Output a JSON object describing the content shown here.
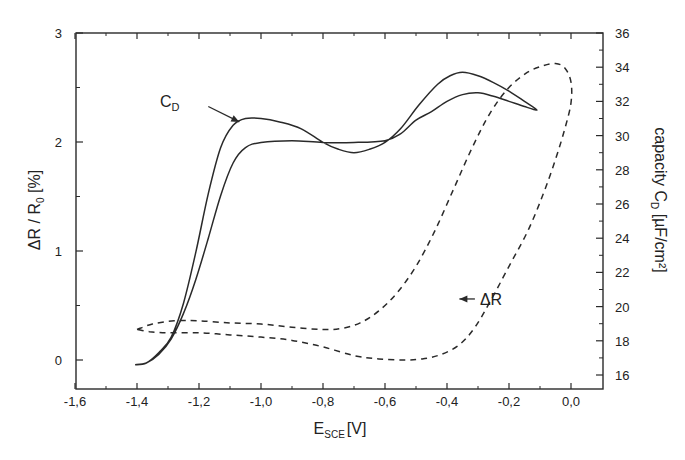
{
  "chart_data": {
    "type": "line",
    "title": "",
    "xlabel": "E_SCE [V]",
    "xlabel_main": "E",
    "xlabel_sub": "SCE",
    "xlabel_unit": "[V]",
    "ylabel_left": "ΔR / R0 [%]",
    "ylabel_left_main": "ΔR / R",
    "ylabel_left_sub": "0",
    "ylabel_left_unit": " [%]",
    "ylabel_right": "capacity C_D [µF/cm²]",
    "ylabel_right_main": "capacity C",
    "ylabel_right_sub": "D",
    "ylabel_right_unit": " [µF/cm²]",
    "xlim": [
      -1.6,
      0.1
    ],
    "ylim_left": [
      -0.26,
      3.0
    ],
    "ylim_right": [
      15.0,
      36.0
    ],
    "grid": false,
    "legend": "none (inline annotations)",
    "x_ticks": [
      -1.6,
      -1.4,
      -1.2,
      -1.0,
      -0.8,
      -0.6,
      -0.4,
      -0.2,
      0.0
    ],
    "x_tick_labels": [
      "-1,6",
      "-1,4",
      "-1,2",
      "-1,0",
      "-0,8",
      "-0,6",
      "-0,4",
      "-0,2",
      "0,0"
    ],
    "y_left_ticks": [
      0,
      1,
      2,
      3
    ],
    "y_left_tick_labels": [
      "0",
      "1",
      "2",
      "3"
    ],
    "y_right_ticks": [
      16,
      18,
      20,
      22,
      24,
      26,
      28,
      30,
      32,
      34,
      36
    ],
    "y_right_tick_labels": [
      "16",
      "18",
      "20",
      "22",
      "24",
      "26",
      "28",
      "30",
      "32",
      "34",
      "36"
    ],
    "annotations": [
      {
        "text_main": "C",
        "text_sub": "D",
        "target": "C_D curve",
        "arrow_from": [
          -1.17,
          31.7
        ],
        "arrow_to": [
          -1.07,
          30.8
        ]
      },
      {
        "text_main": "ΔR",
        "text_sub": "",
        "target": "ΔR curve",
        "arrow_from": [
          -0.31,
          0.56
        ],
        "arrow_to": [
          -0.36,
          0.56
        ]
      }
    ],
    "series": [
      {
        "name": "C_D",
        "axis": "right",
        "unit": "µF/cm²",
        "style": "solid",
        "points": [
          [
            -1.406,
            16.6
          ],
          [
            -1.37,
            16.7
          ],
          [
            -1.33,
            17.3
          ],
          [
            -1.29,
            18.2
          ],
          [
            -1.25,
            20.2
          ],
          [
            -1.21,
            23.2
          ],
          [
            -1.17,
            26.6
          ],
          [
            -1.13,
            29.3
          ],
          [
            -1.09,
            30.6
          ],
          [
            -1.05,
            31.0
          ],
          [
            -1.0,
            31.0
          ],
          [
            -0.94,
            30.8
          ],
          [
            -0.87,
            30.4
          ],
          [
            -0.8,
            29.6
          ],
          [
            -0.75,
            29.2
          ],
          [
            -0.7,
            29.0
          ],
          [
            -0.65,
            29.2
          ],
          [
            -0.6,
            29.6
          ],
          [
            -0.55,
            30.4
          ],
          [
            -0.49,
            31.8
          ],
          [
            -0.43,
            33.0
          ],
          [
            -0.39,
            33.5
          ],
          [
            -0.35,
            33.7
          ],
          [
            -0.3,
            33.5
          ],
          [
            -0.25,
            33.1
          ],
          [
            -0.2,
            32.6
          ],
          [
            -0.15,
            32.0
          ],
          [
            -0.11,
            31.5
          ],
          [
            -0.15,
            31.7
          ],
          [
            -0.2,
            32.0
          ],
          [
            -0.25,
            32.3
          ],
          [
            -0.3,
            32.5
          ],
          [
            -0.35,
            32.4
          ],
          [
            -0.4,
            32.0
          ],
          [
            -0.45,
            31.4
          ],
          [
            -0.5,
            30.9
          ],
          [
            -0.55,
            30.1
          ],
          [
            -0.6,
            29.7
          ],
          [
            -0.7,
            29.6
          ],
          [
            -0.8,
            29.6
          ],
          [
            -0.9,
            29.7
          ],
          [
            -1.0,
            29.6
          ],
          [
            -1.05,
            29.3
          ],
          [
            -1.09,
            28.4
          ],
          [
            -1.13,
            26.5
          ],
          [
            -1.17,
            24.0
          ],
          [
            -1.21,
            21.6
          ],
          [
            -1.25,
            19.6
          ],
          [
            -1.29,
            18.1
          ],
          [
            -1.33,
            17.2
          ],
          [
            -1.37,
            16.7
          ],
          [
            -1.406,
            16.6
          ]
        ]
      },
      {
        "name": "ΔR",
        "axis": "left",
        "unit": "%",
        "style": "dashed",
        "points": [
          [
            -1.4,
            0.28
          ],
          [
            -1.35,
            0.33
          ],
          [
            -1.28,
            0.36
          ],
          [
            -1.2,
            0.36
          ],
          [
            -1.1,
            0.34
          ],
          [
            -1.0,
            0.33
          ],
          [
            -0.9,
            0.3
          ],
          [
            -0.8,
            0.28
          ],
          [
            -0.74,
            0.29
          ],
          [
            -0.68,
            0.34
          ],
          [
            -0.62,
            0.45
          ],
          [
            -0.56,
            0.62
          ],
          [
            -0.5,
            0.86
          ],
          [
            -0.44,
            1.18
          ],
          [
            -0.38,
            1.56
          ],
          [
            -0.32,
            1.94
          ],
          [
            -0.26,
            2.27
          ],
          [
            -0.2,
            2.5
          ],
          [
            -0.14,
            2.64
          ],
          [
            -0.09,
            2.7
          ],
          [
            -0.05,
            2.72
          ],
          [
            -0.02,
            2.68
          ],
          [
            0.0,
            2.55
          ],
          [
            0.0,
            2.36
          ],
          [
            -0.02,
            2.12
          ],
          [
            -0.05,
            1.84
          ],
          [
            -0.09,
            1.52
          ],
          [
            -0.14,
            1.18
          ],
          [
            -0.2,
            0.86
          ],
          [
            -0.26,
            0.54
          ],
          [
            -0.31,
            0.3
          ],
          [
            -0.36,
            0.14
          ],
          [
            -0.42,
            0.05
          ],
          [
            -0.48,
            0.01
          ],
          [
            -0.54,
            0.0
          ],
          [
            -0.62,
            0.01
          ],
          [
            -0.7,
            0.04
          ],
          [
            -0.8,
            0.12
          ],
          [
            -0.9,
            0.18
          ],
          [
            -1.0,
            0.21
          ],
          [
            -1.1,
            0.23
          ],
          [
            -1.2,
            0.25
          ],
          [
            -1.3,
            0.25
          ],
          [
            -1.36,
            0.26
          ],
          [
            -1.4,
            0.28
          ]
        ]
      }
    ]
  },
  "colors": {
    "ink": "#2a2a2a",
    "background": "#ffffff"
  }
}
